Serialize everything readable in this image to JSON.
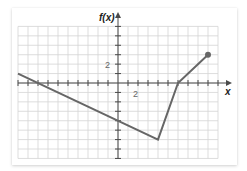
{
  "chart_data": {
    "type": "line",
    "title": "",
    "xlabel": "x",
    "ylabel": "f(x)",
    "xlim": [
      -10,
      10
    ],
    "ylim": [
      -8,
      6
    ],
    "grid": true,
    "grid_step": 1,
    "x_tick_labels": [
      {
        "value": 2,
        "label": "2"
      }
    ],
    "y_tick_labels": [
      {
        "value": 2,
        "label": "2"
      }
    ],
    "series": [
      {
        "name": "f(x)",
        "x": [
          -10,
          4,
          6,
          9
        ],
        "y": [
          1,
          -6,
          0,
          3
        ],
        "left_end": "continues off grid",
        "right_end": "closed dot at (9, 3)"
      }
    ],
    "key_points": {
      "x_intercepts": [
        -8,
        6
      ],
      "y_intercept": -4,
      "minimum": [
        4,
        -6
      ],
      "endpoint": [
        9,
        3
      ]
    },
    "colors": {
      "grid": "#d4d4d4",
      "axis": "#4a4a4a",
      "line": "#666666"
    }
  },
  "labels": {
    "y_axis": "f(x)",
    "x_axis": "x",
    "x_tick_2": "2",
    "y_tick_2": "2"
  }
}
